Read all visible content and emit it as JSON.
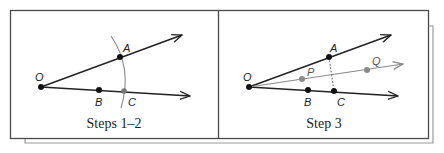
{
  "figure": {
    "panels": [
      {
        "caption": "Steps 1–2",
        "points": {
          "O": "O",
          "A": "A",
          "B": "B",
          "C": "C"
        }
      },
      {
        "caption": "Step 3",
        "points": {
          "O": "O",
          "A": "A",
          "B": "B",
          "C": "C",
          "P": "P",
          "Q": "Q"
        }
      }
    ],
    "colors": {
      "ray": "#222222",
      "construction": "#8a8a8a",
      "frame": "#4a4a4a",
      "shadow_frame": "#9a9a9a"
    }
  }
}
